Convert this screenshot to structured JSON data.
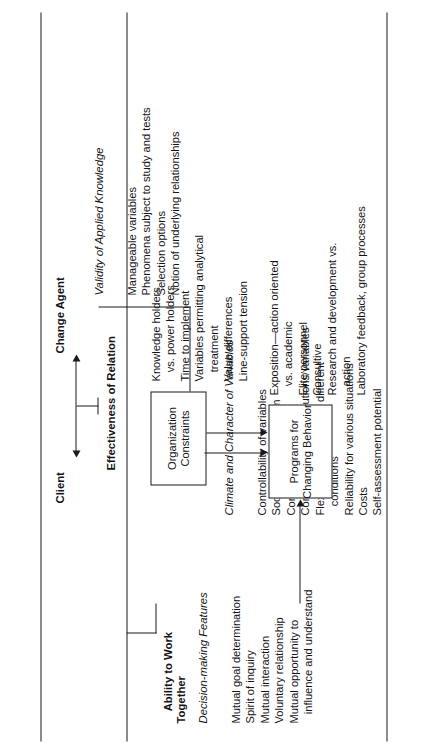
{
  "figure": {
    "orientation": "rotated-90-ccw",
    "axis": {
      "left_label": "Client",
      "right_label": "Change Agent",
      "relation_label": "Effectiveness of Relation"
    },
    "groups": [
      {
        "key": "ability",
        "bracket_label": "Ability to Work\nTogether",
        "heading": "Decision-making Features",
        "items": [
          "Mutual goal determination",
          "Spirit of inquiry",
          "Mutual interaction",
          "Voluntary relationship",
          "Mutual opportunity to",
          "   influence and understand"
        ]
      },
      {
        "key": "validity",
        "heading": "Validity of Applied Knowledge",
        "items": [
          "Manageable variables",
          "Phenomena subject to study and tests",
          "Selection options",
          "Notion of underlying relationships"
        ]
      },
      {
        "key": "climate",
        "heading": "Climate and Character of Variables",
        "items": [
          "Controllability of variables",
          "Social values of system",
          "Controllability",
          "Communicability of solutions/variables",
          "Flexibility/usage under different",
          "   conditions",
          "Reliability for various situations",
          "Costs",
          "Self-assessment potential"
        ]
      }
    ],
    "boxes": [
      {
        "key": "organization_constraints",
        "label": "Organization\nConstraints",
        "items": [
          "Knowledge holders",
          "   vs. power holders",
          "Time to implement",
          "Variables permitting analytical",
          "   treatment",
          "Value differences",
          "Line-support tension"
        ]
      },
      {
        "key": "programs_for_changing_behavior",
        "label": "Programs for\nChanging Behavior",
        "items": [
          "Exposition—action oriented",
          "   vs. academic",
          "Elite personnel",
          "Consultive",
          "Research and development vs.",
          "   action",
          "Laboratory feedback, group processes"
        ]
      }
    ]
  }
}
